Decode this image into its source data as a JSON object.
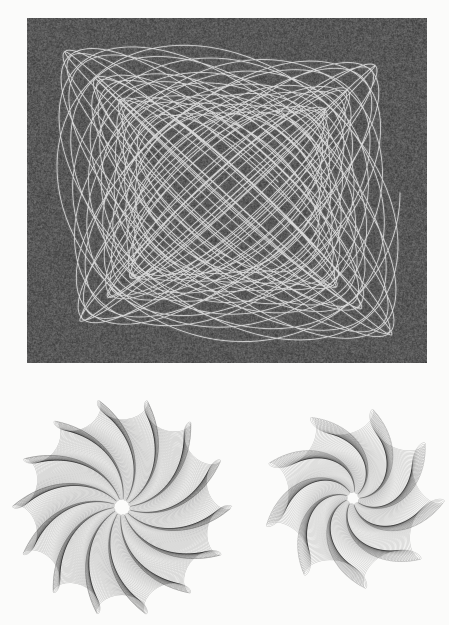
{
  "page": {
    "width": 449,
    "height": 625,
    "background": "#fbfbfa"
  },
  "figures": {
    "oscillogram": {
      "description": "white damped lissajous harmonograph trace on dark grainy ground",
      "frame": {
        "x": 27,
        "y": 18,
        "width": 400,
        "height": 345
      },
      "background": "#585858",
      "noise_amplitude": 34,
      "glow_color": "rgba(255,255,255,0.08)",
      "glow_width": 3,
      "stroke_color": "rgba(244,244,244,0.8)",
      "stroke_width": 0.85,
      "curve": {
        "cx": 201,
        "cy": 175,
        "ax": 172,
        "ay": 149,
        "fx": 0.945,
        "fy": 1.0,
        "px": 1.5708,
        "py": 0,
        "damping": 0.0018,
        "t_max": 358,
        "dt": 0.02
      }
    },
    "rosette_left": {
      "description": "dense rotary harmonograph rosette, 14 scalloped lobes, spiral pinwheel moire core",
      "frame": {
        "x": 8,
        "y": 393,
        "width": 230,
        "height": 230
      },
      "stroke_color": "rgba(15,15,15,0.27)",
      "stroke_width": 0.5,
      "curve": {
        "cx": 114,
        "cy": 114,
        "a": 99,
        "b": 11,
        "q": -12.982,
        "phase": 0,
        "decay_to": 0.08,
        "revolutions": 100,
        "points_per_rev": 260
      }
    },
    "rosette_right": {
      "description": "rotary harmonograph rosette, 9 scalloped petals, radial moire core",
      "frame": {
        "x": 253,
        "y": 400,
        "width": 196,
        "height": 196
      },
      "stroke_color": "rgba(15,15,15,0.24)",
      "stroke_width": 0.5,
      "curve": {
        "cx": 100,
        "cy": 98,
        "a": 78,
        "b": 13.5,
        "q": -7.978,
        "phase": 0.3,
        "decay_to": 0.08,
        "revolutions": 90,
        "points_per_rev": 260
      }
    }
  }
}
